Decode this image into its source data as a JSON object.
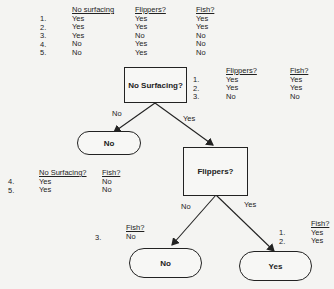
{
  "top_table": {
    "headers": [
      "No surfacing",
      "Flippers?",
      "Fish?"
    ],
    "rows": [
      {
        "n": "1.",
        "no_surfacing": "Yes",
        "flippers": "Yes",
        "fish": "Yes"
      },
      {
        "n": "2.",
        "no_surfacing": "Yes",
        "flippers": "Yes",
        "fish": "Yes"
      },
      {
        "n": "3.",
        "no_surfacing": "Yes",
        "flippers": "No",
        "fish": "No"
      },
      {
        "n": "4.",
        "no_surfacing": "No",
        "flippers": "Yes",
        "fish": "No"
      },
      {
        "n": "5.",
        "no_surfacing": "No",
        "flippers": "Yes",
        "fish": "No"
      }
    ]
  },
  "root_node": {
    "label": "No Surfacing?"
  },
  "root_right_table": {
    "headers": [
      "Flippers?",
      "Fish?"
    ],
    "rows": [
      {
        "n": "1.",
        "flippers": "Yes",
        "fish": "Yes"
      },
      {
        "n": "2.",
        "flippers": "Yes",
        "fish": "Yes"
      },
      {
        "n": "3.",
        "flippers": "No",
        "fish": "No"
      }
    ]
  },
  "edges": {
    "root_no": "No",
    "root_yes": "Yes",
    "flippers_no": "No",
    "flippers_yes": "Yes"
  },
  "leaf_root_no": {
    "label": "No"
  },
  "left_table": {
    "headers": [
      "No Surfacing?",
      "Fish?"
    ],
    "rows": [
      {
        "n": "4.",
        "no_surfacing": "Yes",
        "fish": "No"
      },
      {
        "n": "5.",
        "no_surfacing": "Yes",
        "fish": "No"
      }
    ]
  },
  "flippers_node": {
    "label": "Flippers?"
  },
  "flippers_no_table": {
    "headers": [
      "Fish?"
    ],
    "rows": [
      {
        "n": "3.",
        "fish": "No"
      }
    ]
  },
  "flippers_yes_table": {
    "headers": [
      "Fish?"
    ],
    "rows": [
      {
        "n": "1.",
        "fish": "Yes"
      },
      {
        "n": "2.",
        "fish": "Yes"
      }
    ]
  },
  "leaf_flippers_no": {
    "label": "No"
  },
  "leaf_flippers_yes": {
    "label": "Yes"
  }
}
